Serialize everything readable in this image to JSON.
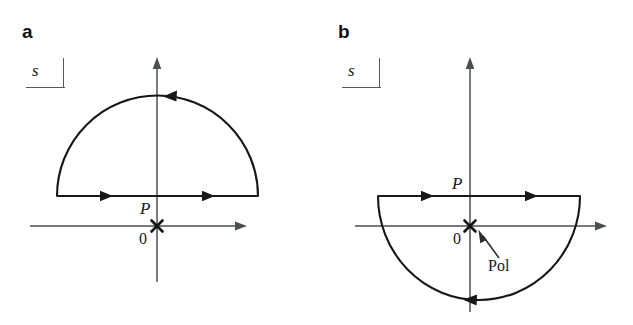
{
  "figure": {
    "kind": "contour-integration-diagram",
    "background_color": "#ffffff",
    "ink_color": "#16181a",
    "axis_color": "#4a4f53"
  },
  "panels": [
    {
      "id": "a",
      "label": "a",
      "plane_label": "s",
      "contour_label": "P",
      "origin_label": "0",
      "pole_marker": "x",
      "description": "Closed contour in the upper half plane: straight segment traversed left to right above the real axis, closed by a large semicircular arc traversed clockwise over the top.",
      "horizontal_axis_label": "",
      "vertical_axis_label": "",
      "pole_annotation": null,
      "arc_side": "upper",
      "segment_direction": "rightward",
      "arc_direction": "leftward"
    },
    {
      "id": "b",
      "label": "b",
      "plane_label": "s",
      "contour_label": "P",
      "origin_label": "0",
      "pole_marker": "x",
      "pole_annotation": "Pol",
      "description": "Closed contour in the lower half plane: straight segment traversed left to right above the real axis, closed by a large semicircular arc dipping below the axis and traversed leftward at the bottom, enclosing the pole at the origin.",
      "horizontal_axis_label": "",
      "vertical_axis_label": "",
      "arc_side": "lower",
      "segment_direction": "rightward",
      "arc_direction": "leftward"
    }
  ],
  "geometry": {
    "panel_a": {
      "origin": [
        157,
        226
      ],
      "real_axis": [
        30,
        240
      ],
      "imag_axis": [
        58,
        282
      ],
      "segment_y": 196,
      "segment_x": [
        57,
        258
      ],
      "arc_apex_y": 96,
      "radius": 100
    },
    "panel_b": {
      "origin": [
        153,
        226
      ],
      "real_axis": [
        38,
        283
      ],
      "imag_axis": [
        58,
        312
      ],
      "segment_y": 196,
      "segment_x": [
        61,
        263
      ],
      "arc_bottom_y": 300,
      "radius": 101
    }
  }
}
